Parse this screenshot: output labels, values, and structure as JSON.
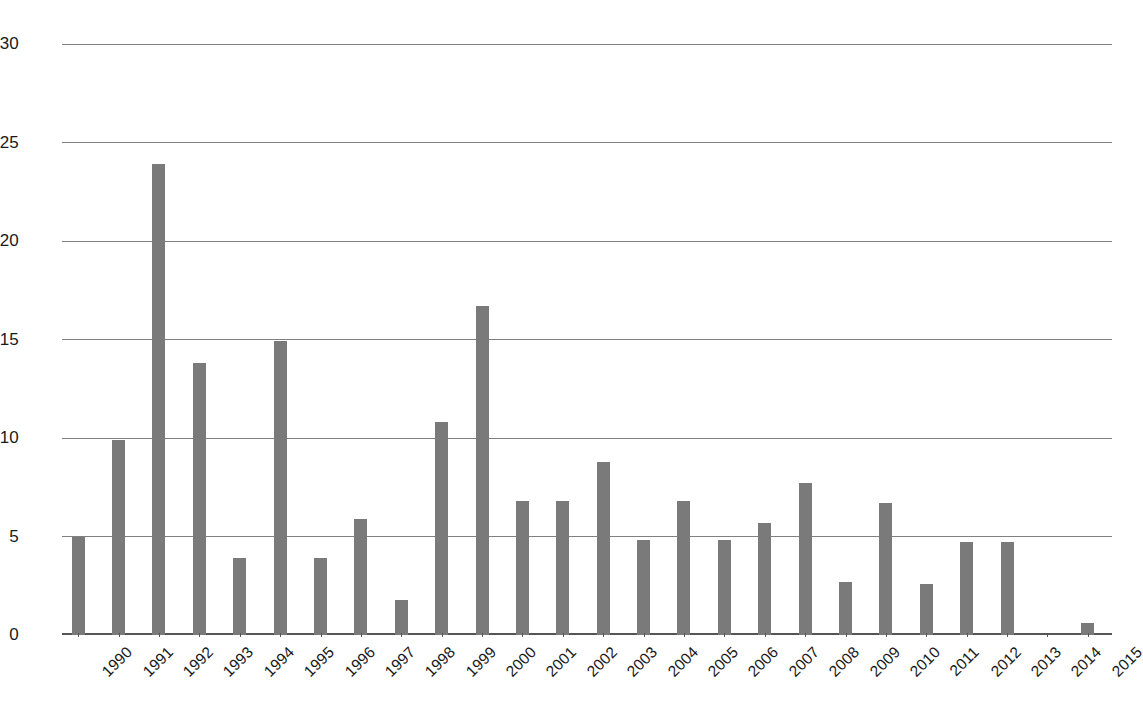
{
  "chart_data": {
    "type": "bar",
    "title": "",
    "subtitle": "",
    "xlabel": "",
    "ylabel": "",
    "ylim": [
      0,
      30
    ],
    "yticks": [
      0,
      5,
      10,
      15,
      20,
      25,
      30
    ],
    "ytick_labels": [
      "0",
      "5",
      "10",
      "15",
      "20",
      "25",
      "30"
    ],
    "grid": true,
    "legend": "none",
    "bar_color": "#7a7a7a",
    "gridline_color": "#808080",
    "axis_color": "#555555",
    "categories": [
      "1990",
      "1991",
      "1992",
      "1993",
      "1994",
      "1995",
      "1996",
      "1997",
      "1998",
      "1999",
      "2000",
      "2001",
      "2002",
      "2003",
      "2004",
      "2005",
      "2006",
      "2007",
      "2008",
      "2009",
      "2010",
      "2011",
      "2012",
      "2013",
      "2014",
      "2015"
    ],
    "values": [
      5.0,
      9.9,
      23.9,
      13.8,
      3.9,
      14.9,
      3.9,
      5.9,
      1.8,
      10.8,
      16.7,
      6.8,
      6.8,
      8.8,
      4.8,
      6.8,
      4.8,
      5.7,
      7.7,
      2.7,
      6.7,
      2.6,
      4.7,
      4.7,
      0.0,
      0.6
    ]
  }
}
